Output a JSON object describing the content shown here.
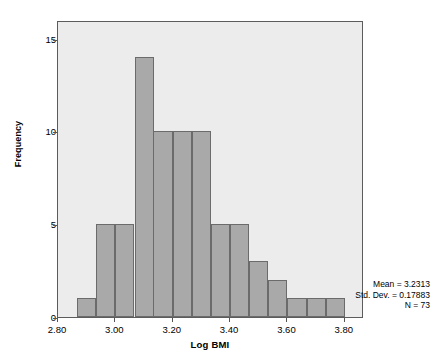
{
  "chart_data": {
    "type": "bar",
    "title": "",
    "xlabel": "Log BMI",
    "ylabel": "Frequency",
    "xlim": [
      2.8,
      3.867
    ],
    "ylim": [
      0,
      16
    ],
    "grid": false,
    "legend": null,
    "bin_width": 0.0667,
    "categories": [
      "2.867",
      "2.933",
      "3.000",
      "3.067",
      "3.133",
      "3.200",
      "3.267",
      "3.333",
      "3.400",
      "3.467",
      "3.533",
      "3.600",
      "3.667",
      "3.733"
    ],
    "bin_starts": [
      2.867,
      2.933,
      3.0,
      3.067,
      3.133,
      3.2,
      3.267,
      3.333,
      3.4,
      3.467,
      3.533,
      3.6,
      3.667,
      3.733
    ],
    "values": [
      1,
      5,
      5,
      14,
      10,
      10,
      10,
      5,
      5,
      3,
      2,
      1,
      1,
      1
    ],
    "xticks": [
      "2.80",
      "3.00",
      "3.20",
      "3.40",
      "3.60",
      "3.80"
    ],
    "xtick_values": [
      2.8,
      3.0,
      3.2,
      3.4,
      3.6,
      3.8
    ],
    "yticks": [
      "0",
      "5",
      "10",
      "15"
    ],
    "ytick_values": [
      0,
      5,
      10,
      15
    ],
    "annotations": {
      "mean": "Mean = 3.2313",
      "std_dev": "Std. Dev. = 0.17883",
      "n": "N = 73"
    },
    "colors": {
      "bar_fill": "#a9a9a9",
      "bar_edge": "#6b6b6b",
      "plot_background": "#ececec",
      "frame": "#5c5c5c",
      "text": "#000000"
    }
  }
}
